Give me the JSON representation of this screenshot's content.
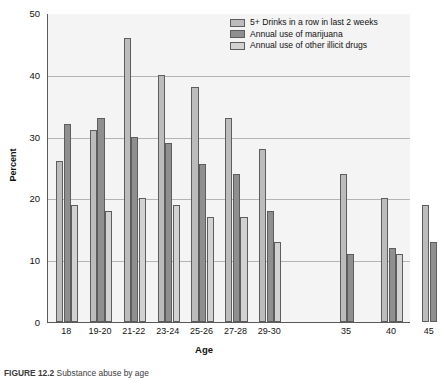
{
  "chart_data": {
    "type": "bar",
    "title": "",
    "xlabel": "Age",
    "ylabel": "Percent",
    "ylim": [
      0,
      50
    ],
    "yticks": [
      0,
      10,
      20,
      30,
      40,
      50
    ],
    "grid": true,
    "legend_position": "top-right",
    "categories": [
      "18",
      "19-20",
      "21-22",
      "23-24",
      "25-26",
      "27-28",
      "29-30",
      "35",
      "40",
      "45"
    ],
    "series": [
      {
        "name": "5+ Drinks in a row in last 2 weeks",
        "color": "#bcbcbc",
        "values": [
          26,
          31,
          46,
          40,
          38,
          33,
          28,
          24,
          20,
          19
        ]
      },
      {
        "name": "Annual use of marijuana",
        "color": "#8f8f8f",
        "values": [
          32,
          33,
          30,
          29,
          25.5,
          24,
          18,
          11,
          12,
          13
        ]
      },
      {
        "name": "Annual use of other illicit drugs",
        "color": "#d2d2d2",
        "values": [
          19,
          18,
          20,
          19,
          17,
          17,
          13,
          null,
          11,
          null
        ]
      }
    ]
  },
  "axes": {
    "y_title": "Percent",
    "x_title": "Age",
    "y_tick_labels": [
      "50",
      "40",
      "30",
      "20",
      "10",
      "0"
    ]
  },
  "legend": {
    "items": [
      {
        "label": "5+ Drinks in a row in last 2 weeks",
        "color": "#bcbcbc"
      },
      {
        "label": "Annual use of marijuana",
        "color": "#8f8f8f"
      },
      {
        "label": "Annual use of other illicit drugs",
        "color": "#d2d2d2"
      }
    ]
  },
  "caption": {
    "figure_number": "FIGURE 12.2",
    "text": "Substance abuse by age"
  }
}
